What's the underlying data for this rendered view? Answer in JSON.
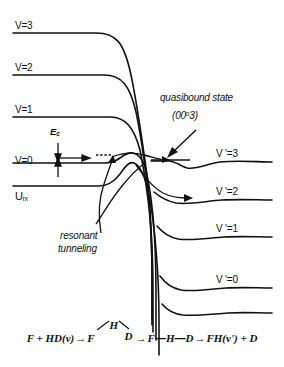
{
  "figure": {
    "type": "potential-energy-curve-diagram",
    "background_color": "#ffffff",
    "line_color": "#111111"
  },
  "left_levels": [
    {
      "label": "V=3",
      "y": 33
    },
    {
      "label": "V=2",
      "y": 75
    },
    {
      "label": "V=1",
      "y": 117
    },
    {
      "label": "V=0",
      "y": 163
    }
  ],
  "left_axis_label": {
    "base": "U",
    "subscript": "rx"
  },
  "barrier_label": {
    "base": "E",
    "subscript": "c"
  },
  "right_levels": [
    {
      "label": "V '=3",
      "y": 162
    },
    {
      "label": "V '=2",
      "y": 200
    },
    {
      "label": "V '=1",
      "y": 237
    },
    {
      "label": "V '=0",
      "y": 288
    }
  ],
  "annotations": {
    "quasibound": {
      "line1": "quasibound state",
      "line2_pre": "(00",
      "line2_sup": "o",
      "line2_post": "3)"
    },
    "resonant": {
      "line1": "resonant",
      "line2": "tunneling"
    }
  },
  "equation": {
    "reactant": "F + HD(v)",
    "arrow": "→",
    "complex_bent": {
      "f": "F",
      "h": "H",
      "d": "D"
    },
    "complex_linear_f": "F",
    "complex_linear_h": "H",
    "complex_linear_d": "D",
    "dash": "—",
    "product": "FH(v') + D"
  }
}
